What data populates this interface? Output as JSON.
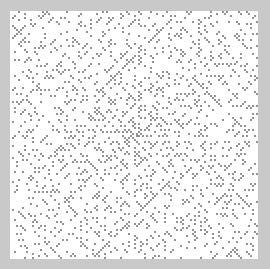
{
  "figure": {
    "type": "ulam-prime-spiral",
    "background_color": "#c9c9c9",
    "panel_color": "#ffffff",
    "dot_color": "#333333",
    "grid_cells": 124,
    "cell_size_px": 2,
    "dot_size_px": 1.4
  }
}
